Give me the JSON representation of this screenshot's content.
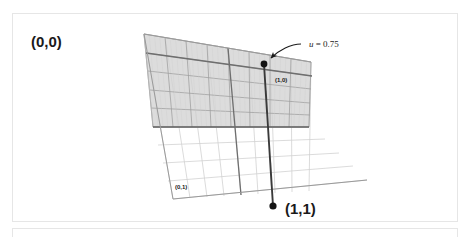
{
  "figure": {
    "corner_labels": [
      {
        "name": "origin",
        "text": "(0,0)",
        "x": 18,
        "y": 33,
        "size": "big"
      },
      {
        "name": "u-max",
        "text": "(1,0)",
        "x": 262,
        "y": 68,
        "size": "small"
      },
      {
        "name": "v-max",
        "text": "(0,1)",
        "x": 162,
        "y": 175,
        "size": "small"
      },
      {
        "name": "uv-max",
        "text": "(1,1)",
        "x": 272,
        "y": 200,
        "size": "big"
      }
    ],
    "annotation": {
      "variable": "u",
      "equals": " = ",
      "value": "0.75",
      "full_text": "u = 0.75",
      "x": 296,
      "y": 33
    },
    "colors": {
      "shaded_fill": "#dcdcdc",
      "grid_dark": "#8c8c8c",
      "grid_light": "#d2d2d2",
      "isoline": "#3a3a3a",
      "dot": "#141414",
      "outline": "#9a9a9a",
      "frame_border": "#e6e6e6",
      "page_background": "#ffffff",
      "text": "#1a1a1a"
    },
    "isoline": {
      "name": "u = 0.75 parameter line",
      "top_point": {
        "x": 251,
        "y": 50
      },
      "bottom_point": {
        "x": 260,
        "y": 192
      }
    },
    "arrow": {
      "name": "annotation-leader",
      "from": {
        "x": 288,
        "y": 30
      },
      "to": {
        "x": 256,
        "y": 45
      }
    },
    "grid": {
      "divisions_u": 8,
      "divisions_v": 8,
      "shaded_rows": 4,
      "shaded_note": "upper portion of the patch is filled grey; remaining grid drawn with light lines only"
    }
  }
}
